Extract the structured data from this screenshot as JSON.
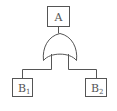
{
  "diagram": {
    "type": "fault-tree",
    "stroke_color": "#555555",
    "background": "#ffffff",
    "top_event": {
      "label": "A"
    },
    "gate": {
      "type": "OR"
    },
    "children": [
      {
        "base": "B",
        "subscript": "1"
      },
      {
        "base": "B",
        "subscript": "2"
      }
    ]
  }
}
